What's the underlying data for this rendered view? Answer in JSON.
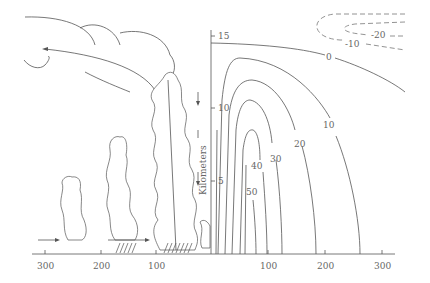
{
  "figure": {
    "y_axis": {
      "label": "Kilometers",
      "ticks": [
        {
          "value": "15",
          "y": 36
        },
        {
          "value": "10",
          "y": 108
        },
        {
          "value": "5",
          "y": 181
        }
      ]
    },
    "x_axis": {
      "ticks_right": [
        {
          "value": "100",
          "x": 268
        },
        {
          "value": "200",
          "x": 325
        },
        {
          "value": "300",
          "x": 382
        }
      ],
      "ticks_left": [
        {
          "value": "300",
          "x": 45
        },
        {
          "value": "200",
          "x": 101
        },
        {
          "value": "100",
          "x": 156
        }
      ]
    },
    "contours_solid": [
      {
        "label": "0"
      },
      {
        "label": "10"
      },
      {
        "label": "20"
      },
      {
        "label": "30"
      },
      {
        "label": "40"
      },
      {
        "label": "50"
      }
    ],
    "contours_dashed": [
      {
        "label": "-10"
      },
      {
        "label": "-20"
      }
    ]
  }
}
